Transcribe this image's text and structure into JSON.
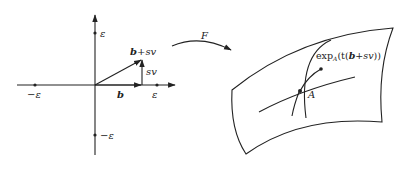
{
  "diagram": {
    "left_panel": {
      "axes": {
        "x_tick_pos_label": "ε",
        "x_tick_neg_label": "−ε",
        "y_tick_pos_label": "ε",
        "y_tick_neg_label": "−ε"
      },
      "vectors": {
        "b_label": "b",
        "sv_label": "sv",
        "sum_label_b": "b",
        "sum_label_plus": "+",
        "sum_label_sv": "sv"
      }
    },
    "map_arrow": {
      "label": "F"
    },
    "right_panel": {
      "point_label": "A",
      "geodesic_label": {
        "prefix": "exp",
        "subscript": "A",
        "open": "(t(",
        "b": "b",
        "plus": "+",
        "sv": "sv",
        "close": "))"
      }
    },
    "colors": {
      "ink": "#222222",
      "background": "#ffffff"
    }
  }
}
